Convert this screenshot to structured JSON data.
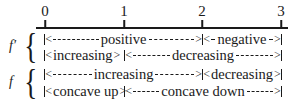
{
  "axis": {
    "ticks": [
      {
        "label": "0",
        "x": 45
      },
      {
        "label": "1",
        "x": 124
      },
      {
        "label": "2",
        "x": 202
      },
      {
        "label": "3",
        "x": 281
      }
    ]
  },
  "groups": [
    {
      "label": "f′",
      "rows": [
        {
          "segments": [
            {
              "text": "positive",
              "from": 0,
              "to": 2
            },
            {
              "text": "negative",
              "from": 2,
              "to": 3
            }
          ]
        },
        {
          "segments": [
            {
              "text": "increasing",
              "from": 0,
              "to": 1
            },
            {
              "text": "decreasing",
              "from": 1,
              "to": 3
            }
          ]
        }
      ]
    },
    {
      "label": "f",
      "rows": [
        {
          "segments": [
            {
              "text": "increasing",
              "from": 0,
              "to": 2
            },
            {
              "text": "decreasing",
              "from": 2,
              "to": 3
            }
          ]
        },
        {
          "segments": [
            {
              "text": "concave up",
              "from": 0,
              "to": 1
            },
            {
              "text": "concave down",
              "from": 1,
              "to": 3
            }
          ]
        }
      ]
    }
  ],
  "brace_glyph": "{"
}
